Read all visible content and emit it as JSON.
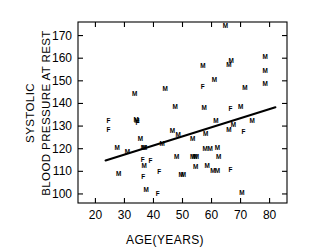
{
  "chart_data": {
    "type": "scatter",
    "title": "",
    "xlabel": "AGE(YEARS)",
    "ylabel_line1": "SYSTOLIC",
    "ylabel_line2": "BLOOD PRESSURE AT REST",
    "xlim": [
      14,
      86
    ],
    "ylim": [
      96,
      176
    ],
    "xticks": [
      20,
      30,
      40,
      50,
      60,
      70,
      80
    ],
    "yticks": [
      100,
      110,
      120,
      130,
      140,
      150,
      160,
      170
    ],
    "xticklabels": [
      "20",
      "30",
      "40",
      "50",
      "60",
      "70",
      "80"
    ],
    "yticklabels": [
      "100",
      "110",
      "120",
      "130",
      "140",
      "150",
      "160",
      "170"
    ],
    "grid": false,
    "legend": "none",
    "marker_style": "letter-sex-code",
    "marker_color": "#000000",
    "series": [
      {
        "name": "Subjects",
        "points": [
          {
            "x": 24.5,
            "y": 132.5,
            "label": "F"
          },
          {
            "x": 24.5,
            "y": 128.5,
            "label": "F"
          },
          {
            "x": 27.5,
            "y": 120.5,
            "label": "M"
          },
          {
            "x": 28.0,
            "y": 108.8,
            "label": "M"
          },
          {
            "x": 31.0,
            "y": 118.5,
            "label": "M"
          },
          {
            "x": 33.5,
            "y": 144.5,
            "label": "M"
          },
          {
            "x": 34.0,
            "y": 132.7,
            "label": "M"
          },
          {
            "x": 34.3,
            "y": 132.3,
            "label": "M"
          },
          {
            "x": 34.5,
            "y": 131.3,
            "label": "F"
          },
          {
            "x": 35.5,
            "y": 124.5,
            "label": "M"
          },
          {
            "x": 36.5,
            "y": 120.6,
            "label": "M"
          },
          {
            "x": 37.0,
            "y": 120.4,
            "label": "M"
          },
          {
            "x": 36.3,
            "y": 115.0,
            "label": "F"
          },
          {
            "x": 36.8,
            "y": 112.6,
            "label": "M"
          },
          {
            "x": 36.5,
            "y": 107.5,
            "label": "F"
          },
          {
            "x": 37.5,
            "y": 102.0,
            "label": "M"
          },
          {
            "x": 39.0,
            "y": 114.8,
            "label": "F"
          },
          {
            "x": 41.5,
            "y": 100.3,
            "label": "F"
          },
          {
            "x": 42.0,
            "y": 110.0,
            "label": "F"
          },
          {
            "x": 43.0,
            "y": 122.0,
            "label": "M"
          },
          {
            "x": 44.0,
            "y": 146.5,
            "label": "M"
          },
          {
            "x": 46.5,
            "y": 128.0,
            "label": "M"
          },
          {
            "x": 47.5,
            "y": 138.5,
            "label": "M"
          },
          {
            "x": 48.0,
            "y": 116.4,
            "label": "M"
          },
          {
            "x": 48.5,
            "y": 126.0,
            "label": "M"
          },
          {
            "x": 49.5,
            "y": 108.3,
            "label": "M"
          },
          {
            "x": 50.3,
            "y": 108.3,
            "label": "M"
          },
          {
            "x": 53.5,
            "y": 124.5,
            "label": "M"
          },
          {
            "x": 53.5,
            "y": 116.4,
            "label": "M"
          },
          {
            "x": 54.2,
            "y": 116.4,
            "label": "M"
          },
          {
            "x": 54.8,
            "y": 116.4,
            "label": "M"
          },
          {
            "x": 54.5,
            "y": 112.0,
            "label": "M"
          },
          {
            "x": 57.0,
            "y": 156.5,
            "label": "M"
          },
          {
            "x": 57.0,
            "y": 147.5,
            "label": "F"
          },
          {
            "x": 57.5,
            "y": 138.3,
            "label": "M"
          },
          {
            "x": 58.0,
            "y": 126.8,
            "label": "M"
          },
          {
            "x": 57.8,
            "y": 120.2,
            "label": "M"
          },
          {
            "x": 58.5,
            "y": 112.3,
            "label": "M"
          },
          {
            "x": 59.5,
            "y": 120.2,
            "label": "M"
          },
          {
            "x": 60.5,
            "y": 110.3,
            "label": "M"
          },
          {
            "x": 61.0,
            "y": 150.5,
            "label": "M"
          },
          {
            "x": 61.5,
            "y": 132.5,
            "label": "M"
          },
          {
            "x": 62.0,
            "y": 120.5,
            "label": "M"
          },
          {
            "x": 62.5,
            "y": 116.5,
            "label": "M"
          },
          {
            "x": 62.0,
            "y": 110.2,
            "label": "M"
          },
          {
            "x": 64.8,
            "y": 174.5,
            "label": "M"
          },
          {
            "x": 66.0,
            "y": 157.0,
            "label": "M"
          },
          {
            "x": 66.8,
            "y": 158.8,
            "label": "M"
          },
          {
            "x": 66.5,
            "y": 137.5,
            "label": "F"
          },
          {
            "x": 66.0,
            "y": 128.3,
            "label": "M"
          },
          {
            "x": 66.5,
            "y": 110.5,
            "label": "F"
          },
          {
            "x": 67.5,
            "y": 130.8,
            "label": "M"
          },
          {
            "x": 70.0,
            "y": 138.5,
            "label": "M"
          },
          {
            "x": 70.5,
            "y": 100.4,
            "label": "M"
          },
          {
            "x": 71.0,
            "y": 127.5,
            "label": "F"
          },
          {
            "x": 71.5,
            "y": 146.8,
            "label": "M"
          },
          {
            "x": 74.0,
            "y": 132.5,
            "label": "M"
          },
          {
            "x": 78.5,
            "y": 160.8,
            "label": "M"
          },
          {
            "x": 78.5,
            "y": 154.5,
            "label": "M"
          },
          {
            "x": 78.5,
            "y": 148.8,
            "label": "M"
          }
        ]
      }
    ],
    "fit_line": {
      "type": "linear-regression",
      "x_start": 23.5,
      "y_start": 114.8,
      "x_end": 82.0,
      "y_end": 138.3
    }
  }
}
